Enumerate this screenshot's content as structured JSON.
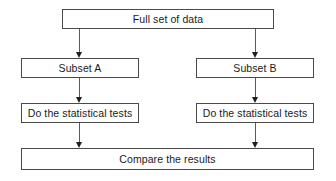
{
  "diagram": {
    "type": "flowchart",
    "background_color": "#ffffff",
    "box_border_color": "#4a4a4a",
    "box_fill_color": "#ffffff",
    "arrow_color": "#1f1f1f",
    "text_color": "#1a1a1a",
    "nodes": [
      {
        "id": "full-set-of-data",
        "label": "Full set of data",
        "x": 62,
        "y": 9,
        "width": 212,
        "height": 20
      },
      {
        "id": "subset-a",
        "label": "Subset A",
        "x": 21,
        "y": 58,
        "width": 118,
        "height": 20
      },
      {
        "id": "subset-b",
        "label": "Subset B",
        "x": 196,
        "y": 58,
        "width": 118,
        "height": 20
      },
      {
        "id": "statistical-tests-left",
        "label": "Do the statistical tests",
        "x": 21,
        "y": 103,
        "width": 118,
        "height": 20
      },
      {
        "id": "statistical-tests-right",
        "label": "Do the statistical tests",
        "x": 196,
        "y": 103,
        "width": 118,
        "height": 20
      },
      {
        "id": "compare-the-results",
        "label": "Compare the results",
        "x": 21,
        "y": 148,
        "width": 293,
        "height": 22
      }
    ],
    "connectors": [
      {
        "id": "full-set-to-subset-a",
        "from": "full-set-of-data",
        "to": "subset-a",
        "x": 79,
        "y": 29,
        "length": 29
      },
      {
        "id": "full-set-to-subset-b",
        "from": "full-set-of-data",
        "to": "subset-b",
        "x": 255,
        "y": 29,
        "length": 29
      },
      {
        "id": "subset-a-to-tests-left",
        "from": "subset-a",
        "to": "statistical-tests-left",
        "x": 79,
        "y": 78,
        "length": 25
      },
      {
        "id": "subset-b-to-tests-right",
        "from": "subset-b",
        "to": "statistical-tests-right",
        "x": 255,
        "y": 78,
        "length": 25
      },
      {
        "id": "tests-left-to-compare",
        "from": "statistical-tests-left",
        "to": "compare-the-results",
        "x": 79,
        "y": 123,
        "length": 25
      },
      {
        "id": "tests-right-to-compare",
        "from": "statistical-tests-right",
        "to": "compare-the-results",
        "x": 255,
        "y": 123,
        "length": 25
      }
    ]
  }
}
